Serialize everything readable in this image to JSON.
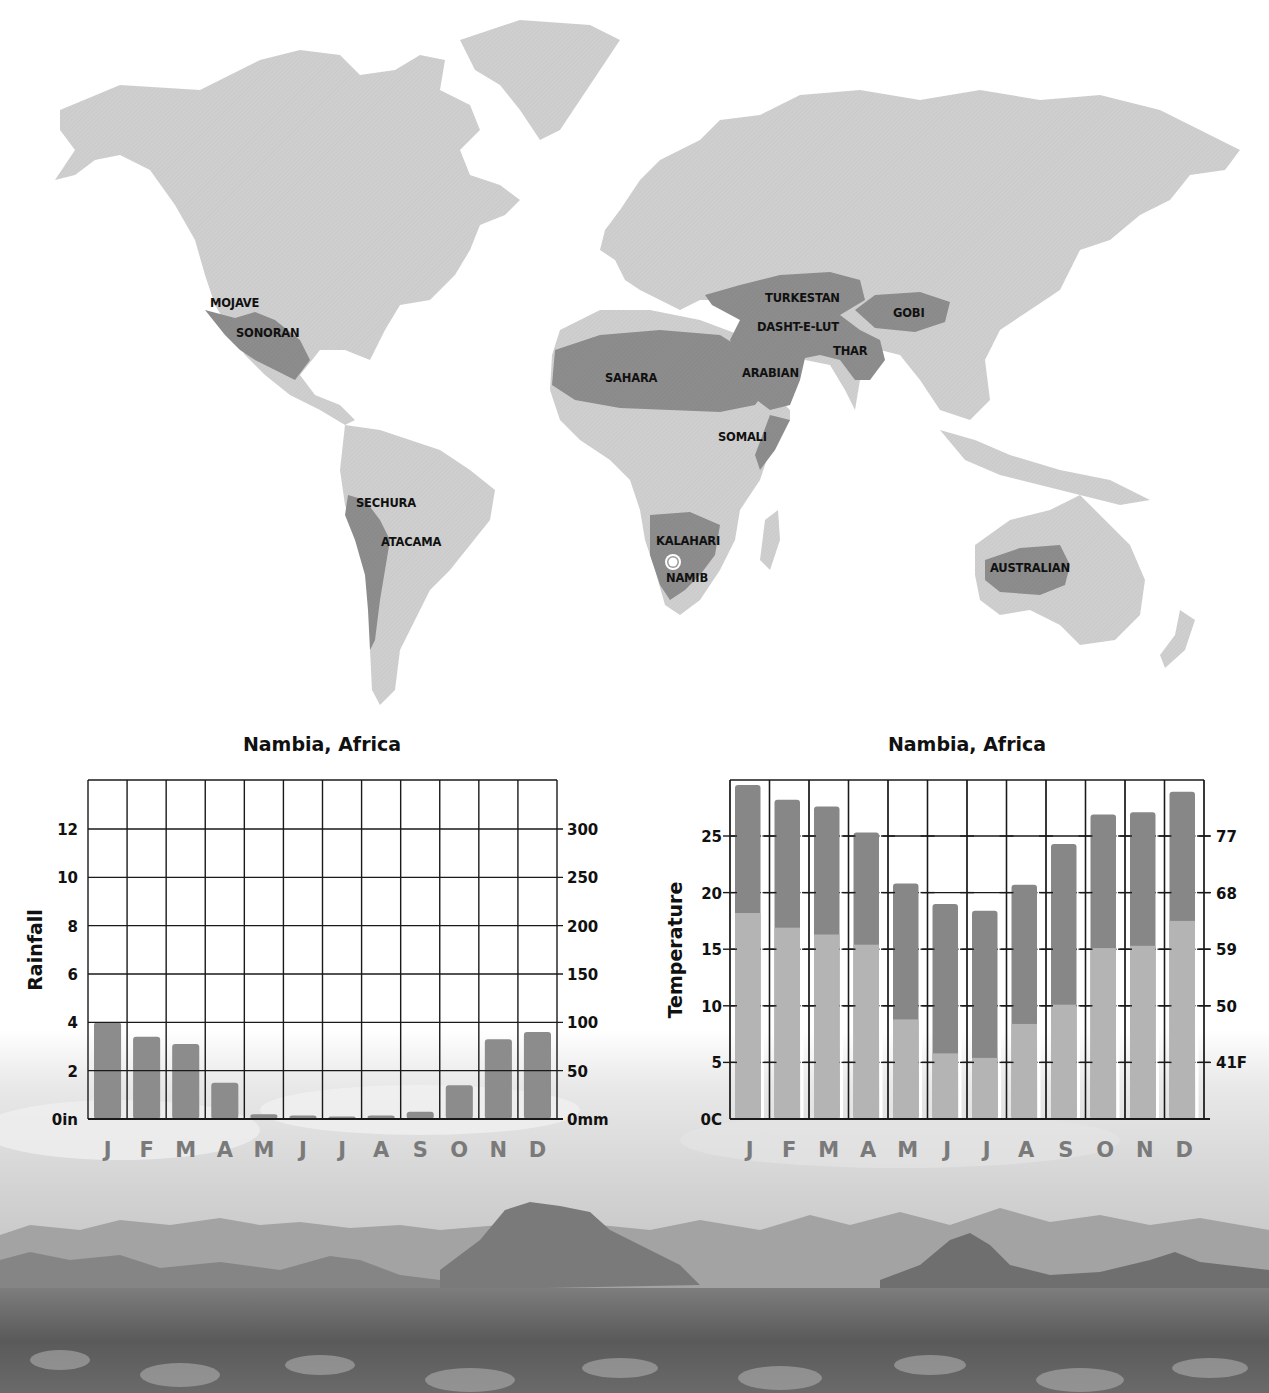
{
  "map": {
    "title": "World deserts map",
    "land_color": "#cfcfcf",
    "desert_color": "#8d8d8d",
    "marker": {
      "name": "location-marker",
      "near": "NAMIB"
    },
    "labels": [
      {
        "text": "MOJAVE",
        "x": 210,
        "y": 307
      },
      {
        "text": "SONORAN",
        "x": 236,
        "y": 337
      },
      {
        "text": "TURKESTAN",
        "x": 765,
        "y": 302
      },
      {
        "text": "GOBI",
        "x": 893,
        "y": 317
      },
      {
        "text": "DASHT-E-LUT",
        "x": 757,
        "y": 331
      },
      {
        "text": "THAR",
        "x": 833,
        "y": 355
      },
      {
        "text": "SAHARA",
        "x": 605,
        "y": 382
      },
      {
        "text": "ARABIAN",
        "x": 742,
        "y": 377
      },
      {
        "text": "SOMALI",
        "x": 718,
        "y": 441
      },
      {
        "text": "SECHURA",
        "x": 356,
        "y": 507
      },
      {
        "text": "ATACAMA",
        "x": 381,
        "y": 546
      },
      {
        "text": "KALAHARI",
        "x": 656,
        "y": 545
      },
      {
        "text": "NAMIB",
        "x": 666,
        "y": 582
      },
      {
        "text": "AUSTRALIAN",
        "x": 990,
        "y": 572
      }
    ]
  },
  "rainfall_chart": {
    "title": "Nambia, Africa",
    "y_axis_title": "Rainfall",
    "left_ticks": [
      "0in",
      "2",
      "4",
      "6",
      "8",
      "10",
      "12"
    ],
    "right_ticks": [
      "0mm",
      "50",
      "100",
      "150",
      "200",
      "250",
      "300"
    ],
    "months": [
      "J",
      "F",
      "M",
      "A",
      "M",
      "J",
      "J",
      "A",
      "S",
      "O",
      "N",
      "D"
    ]
  },
  "temperature_chart": {
    "title": "Nambia, Africa",
    "y_axis_title": "Temperature",
    "left_ticks": [
      "0C",
      "5",
      "10",
      "15",
      "20",
      "25"
    ],
    "right_ticks": [
      "41F",
      "50",
      "59",
      "68",
      "77"
    ],
    "months": [
      "J",
      "F",
      "M",
      "A",
      "M",
      "J",
      "J",
      "A",
      "S",
      "O",
      "N",
      "D"
    ]
  },
  "colors": {
    "bar_rain": "#8c8c8c",
    "bar_temp_high": "#878787",
    "bar_temp_low": "#b4b4b4",
    "grid": "#1a1a1a",
    "month_label": "#7a7a7a"
  },
  "chart_data": [
    {
      "type": "bar",
      "title": "Nambia, Africa",
      "xlabel": "",
      "ylabel": "Rainfall",
      "categories": [
        "J",
        "F",
        "M",
        "A",
        "M",
        "J",
        "J",
        "A",
        "S",
        "O",
        "N",
        "D"
      ],
      "values": [
        4.0,
        3.4,
        3.1,
        1.5,
        0.2,
        0.15,
        0.1,
        0.15,
        0.3,
        1.4,
        3.3,
        3.6
      ],
      "units": "in",
      "secondary_axis": {
        "label": "mm",
        "ticks": [
          0,
          50,
          100,
          150,
          200,
          250,
          300
        ]
      },
      "ylim": [
        0,
        14
      ],
      "yticks": [
        0,
        2,
        4,
        6,
        8,
        10,
        12
      ],
      "grid": true,
      "legend": null
    },
    {
      "type": "bar",
      "title": "Nambia, Africa",
      "xlabel": "",
      "ylabel": "Temperature",
      "categories": [
        "J",
        "F",
        "M",
        "A",
        "M",
        "J",
        "J",
        "A",
        "S",
        "O",
        "N",
        "D"
      ],
      "series": [
        {
          "name": "Average high (C)",
          "values": [
            29.5,
            28.2,
            27.6,
            25.3,
            20.8,
            19.0,
            18.4,
            20.7,
            24.3,
            26.9,
            27.1,
            28.9
          ]
        },
        {
          "name": "Average low (C)",
          "values": [
            18.2,
            16.9,
            16.3,
            15.4,
            8.8,
            5.8,
            5.4,
            8.4,
            10.1,
            15.1,
            15.3,
            17.5
          ]
        }
      ],
      "units": "C",
      "secondary_axis": {
        "label": "F",
        "ticks": [
          41,
          50,
          59,
          68,
          77
        ]
      },
      "ylim": [
        0,
        30
      ],
      "yticks": [
        0,
        5,
        10,
        15,
        20,
        25
      ],
      "grid": true,
      "legend": null
    }
  ]
}
